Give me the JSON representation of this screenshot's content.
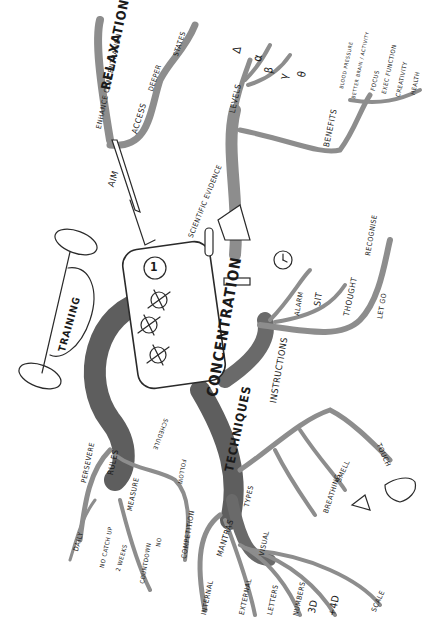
{
  "diagram": {
    "type": "mind-map",
    "center": {
      "label": "CONCENTRATION",
      "badge": "1"
    },
    "branches": [
      {
        "id": "relaxation",
        "label": "RELAXATION",
        "children": [
          "ENHANCE CONCENTRATION",
          "ACCESS",
          "DEEPER",
          "STATES"
        ]
      },
      {
        "id": "aim",
        "label": "AIM"
      },
      {
        "id": "scientific-evidence",
        "label": "SCIENTIFIC EVIDENCE"
      },
      {
        "id": "levels",
        "label": "LEVELS",
        "children": [
          "Δ",
          "α",
          "β",
          "γ",
          "θ"
        ]
      },
      {
        "id": "benefits",
        "label": "BENEFITS",
        "children": [
          "BLOOD PRESSURE",
          "BETTER BRAIN ACTIVITY",
          "FOCUS",
          "EXEC FUNCTION",
          "CREATIVITY",
          "HEALTH"
        ]
      },
      {
        "id": "instructions",
        "label": "INSTRUCTIONS",
        "children": [
          "ALARM",
          "SIT",
          "THOUGHT",
          "RECOGNISE",
          "LET GO"
        ]
      },
      {
        "id": "techniques",
        "label": "TECHNIQUES",
        "children": [
          "TYPES",
          "MANTRAS",
          "INTERNAL",
          "EXTERNAL",
          "VISUAL",
          "LETTERS",
          "NUMBERS",
          "3D",
          "+4D",
          "SCALE",
          "BREATHING",
          "SMELL",
          "TOUCH"
        ]
      },
      {
        "id": "training",
        "label": "TRAINING",
        "children": [
          "PERSEVERE",
          "RULES",
          "MEASURE",
          "DAILY",
          "NO CATCH UP",
          "2 WEEKS",
          "COUNTDOWN",
          "NO",
          "COMPETITION",
          "FOLLOW",
          "SCHEDULE"
        ]
      }
    ]
  },
  "labels": {
    "concentration": "CONCENTRATION",
    "badge": "1",
    "relaxation": "RELAXATION",
    "enhance": "ENHANCE CONCENTRATION",
    "access": "ACCESS",
    "deeper": "DEEPER",
    "states": "STATES",
    "aim": "AIM",
    "scientific": "SCIENTIFIC EVIDENCE",
    "levels": "LEVELS",
    "delta": "Δ",
    "alpha": "α",
    "beta": "β",
    "gamma": "γ",
    "theta": "θ",
    "benefits": "BENEFITS",
    "blood": "BLOOD PRESSURE",
    "brain": "BETTER BRAIN / ACTIVITY",
    "focus": "FOCUS",
    "exec": "EXEC FUNCTION",
    "creativity": "CREATIVITY",
    "health": "HEALTH",
    "instructions": "INSTRUCTIONS",
    "alarm": "ALARM",
    "sit": "SIT",
    "thought": "THOUGHT",
    "recognise": "RECOGNISE",
    "letgo": "LET GO",
    "techniques": "TECHNIQUES",
    "types": "TYPES",
    "mantras": "MANTRAS",
    "internal": "INTERNAL",
    "external": "EXTERNAL",
    "visual": "VISUAL",
    "letters": "LETTERS",
    "numbers": "NUMBERS",
    "d3": "3D",
    "d4": "+4D",
    "scale": "SCALE",
    "breathing": "BREATHING",
    "smell": "SMELL",
    "touch": "TOUCH",
    "training": "TRAINING",
    "persevere": "PERSEVERE",
    "rules": "RULES",
    "measure": "MEASURE",
    "daily": "DAILY",
    "nocatch": "NO CATCH UP",
    "weeks": "2 WEEKS",
    "countdown": "COUNTDOWN",
    "no": "NO",
    "competition": "COMPETITION",
    "follow": "FOLLOW",
    "schedule": "SCHEDULE"
  },
  "colors": {
    "branch_light": "#a8a8a8",
    "branch_dark": "#5e5e5e",
    "ink": "#1a1a1a",
    "background": "#ffffff"
  }
}
